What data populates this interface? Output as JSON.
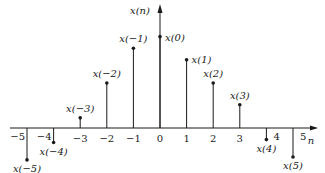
{
  "chart_data": {
    "type": "stem",
    "title": "",
    "xlabel": "n",
    "ylabel": "x(n)",
    "x": [
      -5,
      -4,
      -3,
      -2,
      -1,
      0,
      1,
      2,
      3,
      4,
      5
    ],
    "tick_labels": [
      "-5",
      "-4",
      "-3",
      "-2",
      "-1",
      "0",
      "1",
      "2",
      "3",
      "4",
      "5"
    ],
    "values": [
      -2.2,
      -1.0,
      0.7,
      3.1,
      5.5,
      6.3,
      4.7,
      3.1,
      1.6,
      -0.8,
      -2.0
    ],
    "point_labels": [
      "x(-5)",
      "x(-4)",
      "x(-3)",
      "x(-2)",
      "x(-1)",
      "x(0)",
      "x(1)",
      "x(2)",
      "x(3)",
      "x(4)",
      "x(5)"
    ],
    "grid": false,
    "legend": null,
    "note": "Qualitative discrete-time sequence; amplitudes are relative and unlabeled"
  },
  "colors": {
    "ink": "#1a1a1a",
    "background": "#ffffff"
  }
}
